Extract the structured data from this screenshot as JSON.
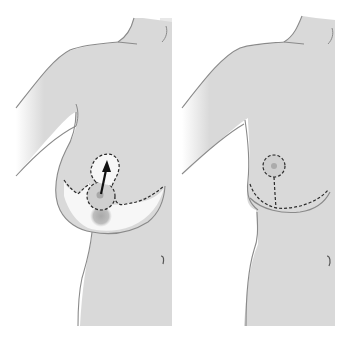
{
  "figure": {
    "title": "Vertical and horizontal scar breast reduction (before and after)",
    "panels": [
      {
        "id": "before",
        "label": "Preoperative markings",
        "elements": [
          "torso-outline",
          "arm-outline",
          "keyhole-marking",
          "nipple-areola-complex",
          "elevation-arrow",
          "resection-area",
          "navel"
        ]
      },
      {
        "id": "after",
        "label": "Postoperative anchor scar",
        "elements": [
          "torso-outline",
          "arm-outline",
          "areola-scar",
          "vertical-scar",
          "inframammary-scar",
          "navel"
        ]
      }
    ]
  },
  "colors": {
    "background": "#ffffff",
    "skin": "#d9d9d9",
    "outline": "#8a8a8a",
    "dashed_line": "#2a2a2a",
    "resection": "#f4f4f4",
    "areola": "#bcbcbc",
    "nipple": "#a8a8a8",
    "arrow": "#111111",
    "blur_patch": "#b5b5b5"
  }
}
